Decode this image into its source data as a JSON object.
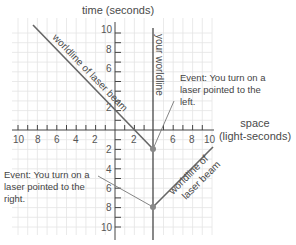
{
  "axes": {
    "time_label": "time (seconds)",
    "space_label_line1": "space",
    "space_label_line2": "(light-seconds)",
    "x_ticks_left": [
      "10",
      "8",
      "6",
      "4",
      "2"
    ],
    "x_ticks_right": [
      "2",
      "6",
      "8",
      "10"
    ],
    "t_ticks_up": [
      "10",
      "8",
      "6",
      "2"
    ],
    "t_ticks_down": [
      "2",
      "4",
      "6",
      "8",
      "10"
    ]
  },
  "labels": {
    "your_worldline": "your worldline",
    "beam_left": "worldline of laser beam",
    "beam_right_line1": "worldline of",
    "beam_right_line2": "laser beam"
  },
  "events": [
    {
      "name": "event-left-laser",
      "lines": [
        "Event: You turn on a",
        "laser pointed to the",
        "left."
      ],
      "x": 4,
      "t": -2
    },
    {
      "name": "event-right-laser",
      "lines": [
        "Event: You turn on a",
        "laser pointed to the",
        "right."
      ],
      "x": 4,
      "t": -8
    }
  ],
  "colors": {
    "axis": "#444444",
    "grid": "#e4e4e4",
    "worldline": "#555555",
    "beam": "#666666",
    "event_dot": "#888888"
  }
}
